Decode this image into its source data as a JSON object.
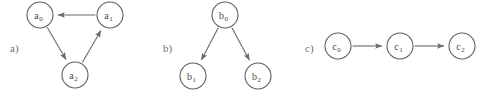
{
  "figure": {
    "background_color": "#ffffff",
    "stroke_color": "#6a6a6a",
    "node_stroke_color": "#5f5f5f",
    "node_fill_color": "#ffffff",
    "label_color": "#6e6e6e",
    "node_text_color": "#4a4a4a"
  },
  "panels": [
    {
      "id": "a",
      "label": "a)",
      "label_x": 10,
      "label_y": 52,
      "description": "directed cycle of three nodes",
      "nodes": [
        {
          "id": "a0",
          "base": "a",
          "sub": "0",
          "cx": 40,
          "cy": 15,
          "r": 13
        },
        {
          "id": "a1",
          "base": "a",
          "sub": "1",
          "cx": 110,
          "cy": 15,
          "r": 13
        },
        {
          "id": "a2",
          "base": "a",
          "sub": "2",
          "cx": 75,
          "cy": 75,
          "r": 13
        }
      ],
      "edges": [
        {
          "from": "a0",
          "to": "a2"
        },
        {
          "from": "a2",
          "to": "a1"
        },
        {
          "from": "a1",
          "to": "a0"
        }
      ]
    },
    {
      "id": "b",
      "label": "b)",
      "label_x": 163,
      "label_y": 52,
      "description": "tree with one root and two children",
      "nodes": [
        {
          "id": "b0",
          "base": "b",
          "sub": "0",
          "cx": 225,
          "cy": 15,
          "r": 13
        },
        {
          "id": "b1",
          "base": "b",
          "sub": "1",
          "cx": 193,
          "cy": 76,
          "r": 13
        },
        {
          "id": "b2",
          "base": "b",
          "sub": "2",
          "cx": 258,
          "cy": 76,
          "r": 13
        }
      ],
      "edges": [
        {
          "from": "b0",
          "to": "b1"
        },
        {
          "from": "b0",
          "to": "b2"
        }
      ]
    },
    {
      "id": "c",
      "label": "c)",
      "label_x": 305,
      "label_y": 52,
      "description": "linear chain of three nodes",
      "nodes": [
        {
          "id": "c0",
          "base": "c",
          "sub": "0",
          "cx": 338,
          "cy": 46,
          "r": 13
        },
        {
          "id": "c1",
          "base": "c",
          "sub": "1",
          "cx": 400,
          "cy": 46,
          "r": 13
        },
        {
          "id": "c2",
          "base": "c",
          "sub": "2",
          "cx": 462,
          "cy": 46,
          "r": 13
        }
      ],
      "edges": [
        {
          "from": "c0",
          "to": "c1"
        },
        {
          "from": "c1",
          "to": "c2"
        }
      ]
    }
  ]
}
